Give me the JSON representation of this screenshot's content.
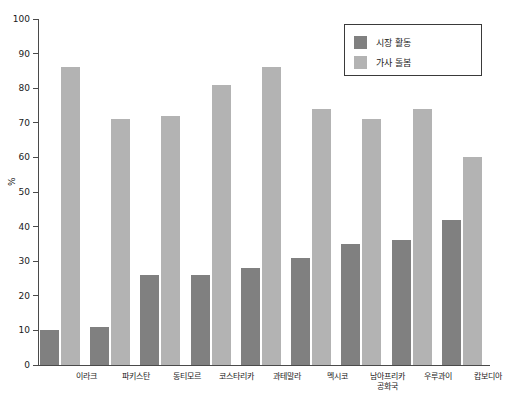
{
  "chart_data": {
    "type": "bar",
    "title": "",
    "xlabel": "",
    "ylabel": "%",
    "ylim": [
      0,
      100
    ],
    "ytick_step": 10,
    "yticks": [
      0,
      10,
      20,
      30,
      40,
      50,
      60,
      70,
      80,
      90,
      100
    ],
    "grid": false,
    "legend_position": "top-right",
    "categories": [
      "이라크",
      "파키스탄",
      "동티모르",
      "코스타리카",
      "과테말라",
      "멕시코",
      "남아프리카\n공화국",
      "우루과이",
      "캄보디아"
    ],
    "series": [
      {
        "name": "시장 활동",
        "color": "#808080",
        "values": [
          10,
          11,
          26,
          26,
          28,
          31,
          35,
          36,
          42
        ]
      },
      {
        "name": "가사 돌봄",
        "color": "#b3b3b3",
        "values": [
          86,
          71,
          72,
          81,
          86,
          74,
          71,
          74,
          60
        ]
      }
    ]
  },
  "legend": {
    "items": [
      {
        "label": "시장 활동",
        "color": "#808080"
      },
      {
        "label": "가사 돌봄",
        "color": "#b3b3b3"
      }
    ]
  }
}
